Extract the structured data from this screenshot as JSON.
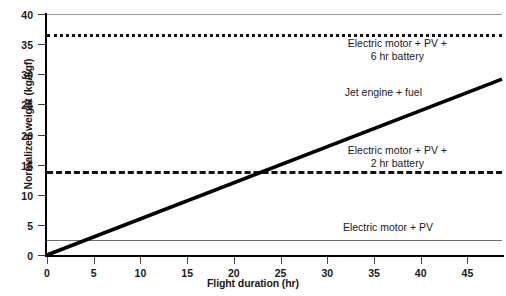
{
  "chart_data": {
    "type": "line",
    "title": "",
    "xlabel": "Flight duration (hr)",
    "ylabel": "Normalized weight (kg/kgf)",
    "xlim": [
      0,
      48.7
    ],
    "ylim": [
      0,
      40
    ],
    "xticks": [
      0,
      5,
      10,
      15,
      20,
      25,
      30,
      35,
      40,
      45
    ],
    "yticks": [
      0,
      5,
      10,
      15,
      20,
      25,
      30,
      35,
      40
    ],
    "grid": false,
    "legend": "inline-annotations",
    "series": [
      {
        "name": "Electric motor + PV + 6 hr battery",
        "style": "dotted",
        "color": "#111111",
        "type": "constant",
        "value": 36.7,
        "label": "Electric motor + PV +\n6 hr battery"
      },
      {
        "name": "Jet engine + fuel",
        "style": "solid-thick",
        "color": "#000000",
        "type": "linear",
        "intercept": 0,
        "slope": 0.6,
        "x": [
          0,
          48.7
        ],
        "y": [
          0,
          29.2
        ],
        "label": "Jet engine + fuel"
      },
      {
        "name": "Electric motor + PV + 2 hr battery",
        "style": "dashed",
        "color": "#111111",
        "type": "constant",
        "value": 14.0,
        "label": "Electric motor + PV +\n2 hr battery"
      },
      {
        "name": "Electric motor + PV",
        "style": "solid-thin",
        "color": "#6e6e6e",
        "type": "constant",
        "value": 2.5,
        "label": "Electric motor + PV"
      }
    ],
    "annotations": [
      {
        "text": "Electric motor + PV +\n6 hr battery",
        "x": 37.5,
        "y": 34.0
      },
      {
        "text": "Jet engine + fuel",
        "x": 36.0,
        "y": 27.0
      },
      {
        "text": "Electric motor + PV +\n2 hr battery",
        "x": 37.5,
        "y": 16.2
      },
      {
        "text": "Electric motor + PV",
        "x": 36.5,
        "y": 4.6
      }
    ]
  },
  "axes": {
    "y_title": "Normalized weight (kg/kgf)",
    "x_title": "Flight duration (hr)",
    "y_tick_labels": [
      "0",
      "5",
      "10",
      "15",
      "20",
      "25",
      "30",
      "35",
      "40"
    ],
    "x_tick_labels": [
      "0",
      "5",
      "10",
      "15",
      "20",
      "25",
      "30",
      "35",
      "40",
      "45"
    ]
  },
  "colors": {
    "axis": "#000000",
    "frame": "#9a9a9a",
    "series_dark": "#111111",
    "series_gray": "#6e6e6e",
    "text": "#1a1a1a",
    "background": "#ffffff"
  }
}
